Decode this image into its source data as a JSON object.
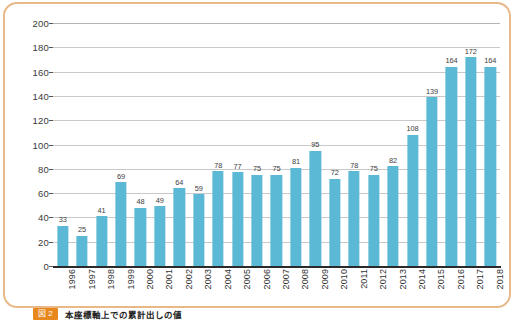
{
  "chart_data": {
    "type": "bar",
    "title": "",
    "xlabel": "",
    "ylabel": "",
    "ylim": [
      0,
      200
    ],
    "ytick_step": 20,
    "yticks": [
      200,
      180,
      160,
      140,
      120,
      100,
      80,
      60,
      40,
      20,
      0
    ],
    "grid": true,
    "legend": "none",
    "bar_color": "#5cb9d6",
    "categories": [
      "1996",
      "1997",
      "1998",
      "1999",
      "2000",
      "2001",
      "2002",
      "2003",
      "2004",
      "2005",
      "2006",
      "2007",
      "2008",
      "2009",
      "2010",
      "2011",
      "2012",
      "2013",
      "2014",
      "2015",
      "2016",
      "2017",
      "2018"
    ],
    "values": [
      33,
      25,
      41,
      69,
      48,
      49,
      64,
      59,
      78,
      77,
      75,
      75,
      81,
      95,
      72,
      78,
      75,
      82,
      108,
      139,
      164,
      172,
      164
    ],
    "data_labels": [
      "33",
      "25",
      "41",
      "69",
      "48",
      "49",
      "64",
      "59",
      "78",
      "77",
      "75",
      "75",
      "81",
      "95",
      "72",
      "78",
      "75",
      "82",
      "108",
      "139",
      "164",
      "172",
      "164"
    ]
  },
  "caption": {
    "badge": "図 2",
    "text": "本座標軸上での累計出しの値"
  },
  "colors": {
    "frame": "#e8b887",
    "bar": "#5cb9d6",
    "gridline": "#c9c9c9",
    "axis": "#2a2a2a",
    "badge": "#e8871e"
  }
}
